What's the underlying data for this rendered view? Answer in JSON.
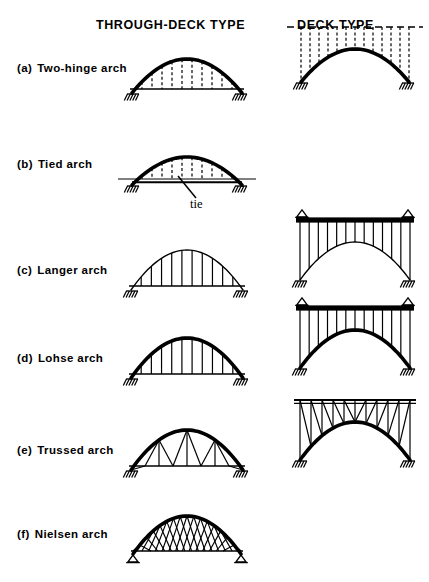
{
  "figure": {
    "title_columns": {
      "through_deck": "THROUGH-DECK  TYPE",
      "deck": "DECK  TYPE"
    },
    "annotations": {
      "tie_label": "tie"
    },
    "style": {
      "ink": "#000000",
      "paper": "#ffffff",
      "arch_thick": 3.6,
      "arch_thin": 1.4,
      "member_width": 1.2
    },
    "rows": [
      {
        "tag": "(a)",
        "name": "Two-hinge arch",
        "label_top": 62,
        "through": {
          "present": true,
          "arch_style": "thick",
          "hanger_style": "dashed",
          "web": "vertical",
          "deck_level": "low",
          "deck_style": "solid",
          "support": "hatched",
          "span": 110,
          "rise": 34,
          "deck_offset": 4
        },
        "deck": {
          "present": true,
          "arch_style": "thick",
          "column_style": "dashed",
          "web": "vertical",
          "deck_style": "dashed",
          "support": "hatched",
          "span": 108,
          "rise": 33,
          "deck_overhang": 14
        }
      },
      {
        "tag": "(b)",
        "name": "Tied arch",
        "label_top": 158,
        "through": {
          "present": true,
          "arch_style": "thick",
          "hanger_style": "dashed",
          "web": "vertical",
          "deck_level": "low",
          "deck_style": "solid-tie",
          "support": "hatched",
          "span": 110,
          "rise": 28,
          "deck_offset": 6,
          "tie_stub": 14
        },
        "deck": {
          "present": false
        }
      },
      {
        "tag": "(c)",
        "name": "Langer arch",
        "label_top": 264,
        "through": {
          "present": true,
          "arch_style": "thin",
          "hanger_style": "solid",
          "web": "vertical",
          "deck_level": "low",
          "deck_style": "solid",
          "support": "hatched",
          "span": 112,
          "rise": 40,
          "deck_offset": 4
        },
        "deck": {
          "present": true,
          "arch_style": "thin",
          "column_style": "solid",
          "web": "vertical",
          "deck_style": "thick-bar",
          "support": "hatched",
          "bearing": "triangle",
          "span": 110,
          "rise": 38,
          "deck_overhang": 4
        }
      },
      {
        "tag": "(d)",
        "name": "Lohse arch",
        "label_top": 352,
        "through": {
          "present": true,
          "arch_style": "thick",
          "hanger_style": "solid",
          "web": "vertical",
          "deck_level": "low",
          "deck_style": "solid",
          "support": "hatched",
          "span": 112,
          "rise": 40,
          "deck_offset": 4
        },
        "deck": {
          "present": true,
          "arch_style": "thick",
          "column_style": "solid",
          "web": "vertical",
          "deck_style": "thick-bar",
          "support": "hatched",
          "bearing": "triangle",
          "span": 110,
          "rise": 38,
          "deck_overhang": 4
        }
      },
      {
        "tag": "(e)",
        "name": "Trussed arch",
        "label_top": 444,
        "through": {
          "present": true,
          "arch_style": "thick",
          "hanger_style": "solid",
          "web": "truss",
          "deck_level": "low",
          "deck_style": "solid",
          "support": "hatched",
          "span": 112,
          "rise": 40,
          "deck_offset": 4
        },
        "deck": {
          "present": true,
          "arch_style": "thick",
          "column_style": "solid",
          "web": "truss",
          "deck_style": "thin-bar",
          "support": "hatched",
          "span": 110,
          "rise": 38,
          "deck_overhang": 6
        }
      },
      {
        "tag": "(f)",
        "name": "Nielsen arch",
        "label_top": 528,
        "through": {
          "present": true,
          "arch_style": "thick",
          "hanger_style": "crossed",
          "web": "network",
          "deck_level": "low",
          "deck_style": "solid",
          "support": "triangle",
          "span": 108,
          "rise": 38,
          "deck_offset": 3
        },
        "deck": {
          "present": false
        }
      }
    ],
    "geometry": {
      "through_center_x": 187,
      "deck_center_x": 355,
      "row_baselines": [
        93,
        185,
        290,
        378,
        470,
        554
      ]
    }
  }
}
